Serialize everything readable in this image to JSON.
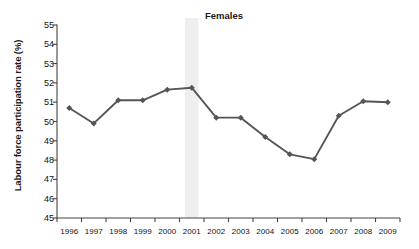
{
  "chart_data": {
    "type": "line",
    "title": "Females",
    "xlabel": "",
    "ylabel": "Labour force participation rate (%)",
    "categories": [
      "1996",
      "1997",
      "1998",
      "1999",
      "2000",
      "2001",
      "2002",
      "2003",
      "2004",
      "2005",
      "2006",
      "2007",
      "2008",
      "2009"
    ],
    "values": [
      50.7,
      49.9,
      51.1,
      51.1,
      51.65,
      51.75,
      50.2,
      50.2,
      49.2,
      48.3,
      48.05,
      50.3,
      51.05,
      51.0
    ],
    "series": [
      {
        "name": "Females",
        "values": [
          50.7,
          49.9,
          51.1,
          51.1,
          51.65,
          51.75,
          50.2,
          50.2,
          49.2,
          48.3,
          48.05,
          50.3,
          51.05,
          51.0
        ]
      }
    ],
    "ylim": [
      45,
      55
    ],
    "ytick_labels": [
      "55",
      "54",
      "53",
      "52",
      "51",
      "50",
      "49",
      "48",
      "47",
      "46",
      "45"
    ],
    "ytick_values": [
      55,
      54,
      53,
      52,
      51,
      50,
      49,
      48,
      47,
      46,
      45
    ],
    "xtick_labels": [
      "1996",
      "1997",
      "1998",
      "1999",
      "2000",
      "2001",
      "2002",
      "2003",
      "2004",
      "2005",
      "2006",
      "2007",
      "2008",
      "2009"
    ],
    "grid": false,
    "legend": "none",
    "marker": "diamond",
    "line_color": "#555555",
    "marker_color": "#555555",
    "axis_color": "#444444",
    "highlight_band": {
      "label": "2001",
      "color": "#eeeeee",
      "x_start": 2000.72,
      "x_end": 2001.28
    }
  }
}
